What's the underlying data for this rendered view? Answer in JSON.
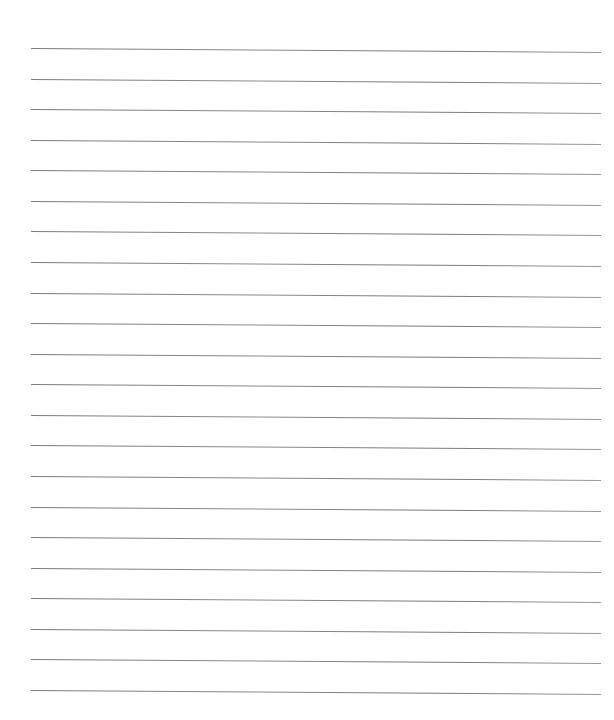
{
  "document": {
    "type": "lined-paper",
    "line_count": 22,
    "line_color": "#808080",
    "background": "#ffffff",
    "first_line_y": 48,
    "line_spacing": 30.57,
    "line_left_x": 31,
    "line_width": 570
  }
}
